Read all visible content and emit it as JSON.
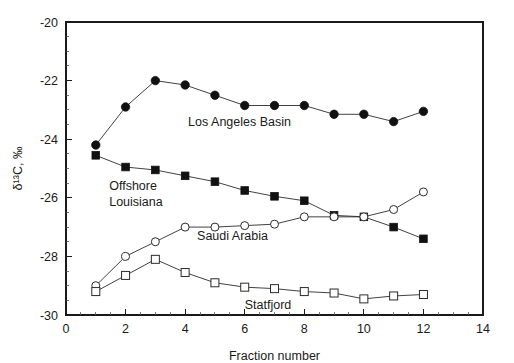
{
  "chart_data": {
    "type": "line",
    "title": "",
    "xlabel": "Fraction number",
    "ylabel": "δ¹³C, ‰",
    "xlim": [
      0,
      14
    ],
    "ylim": [
      -30,
      -20
    ],
    "x_ticks": [
      0,
      2,
      4,
      6,
      8,
      10,
      12,
      14
    ],
    "y_ticks": [
      -30,
      -28,
      -26,
      -24,
      -22,
      -20
    ],
    "x_tick_labels": [
      "0",
      "2",
      "4",
      "6",
      "8",
      "10",
      "12",
      "14"
    ],
    "y_tick_labels": [
      "-30",
      "-28",
      "-26",
      "-24",
      "-22",
      "-20"
    ],
    "x_minor_step": 0.5,
    "y_minor_step": 0.5,
    "grid": false,
    "legend_position": "inline-annotations",
    "x": [
      1,
      2,
      3,
      4,
      5,
      6,
      7,
      8,
      9,
      10,
      11,
      12
    ],
    "series": [
      {
        "name": "Los Angeles Basin",
        "marker": "filled-circle",
        "x": [
          1,
          2,
          3,
          4,
          5,
          6,
          7,
          8,
          9,
          10,
          11,
          12
        ],
        "values": [
          -24.2,
          -22.9,
          -22.0,
          -22.15,
          -22.5,
          -22.85,
          -22.85,
          -22.85,
          -23.15,
          -23.15,
          -23.4,
          -23.05
        ],
        "label_x": 4.1,
        "label_y": -23.55,
        "label_anchor": "start"
      },
      {
        "name": "Offshore Louisiana",
        "marker": "filled-square",
        "x": [
          1,
          2,
          3,
          4,
          5,
          6,
          7,
          8,
          9,
          10,
          11,
          12
        ],
        "values": [
          -24.55,
          -24.95,
          -25.05,
          -25.25,
          -25.45,
          -25.75,
          -25.95,
          -26.1,
          -26.6,
          -26.65,
          -27.0,
          -27.4
        ],
        "label_lines": [
          "Offshore",
          "Louisiana"
        ],
        "label_x": 1.45,
        "label_y": -25.75,
        "label_anchor": "start"
      },
      {
        "name": "Saudi Arabia",
        "marker": "open-circle",
        "x": [
          1,
          2,
          3,
          4,
          5,
          6,
          7,
          8,
          9,
          10,
          11,
          12
        ],
        "values": [
          -29.0,
          -28.0,
          -27.5,
          -27.0,
          -27.0,
          -26.95,
          -26.9,
          -26.65,
          -26.65,
          -26.65,
          -26.4,
          -25.8
        ],
        "label_x": 4.4,
        "label_y": -27.45,
        "label_anchor": "start"
      },
      {
        "name": "Statfjord",
        "marker": "open-square",
        "x": [
          1,
          2,
          3,
          4,
          5,
          6,
          7,
          8,
          9,
          10,
          11,
          12
        ],
        "values": [
          -29.2,
          -28.65,
          -28.1,
          -28.55,
          -28.9,
          -29.05,
          -29.1,
          -29.2,
          -29.25,
          -29.45,
          -29.35,
          -29.3
        ],
        "label_x": 6.0,
        "label_y": -29.78,
        "label_anchor": "start"
      }
    ]
  },
  "colors": {
    "axis": "#1a1a1a",
    "line": "#2b2b2b",
    "marker_fill": "#111111",
    "marker_open_fill": "#ffffff",
    "background": "#ffffff"
  }
}
